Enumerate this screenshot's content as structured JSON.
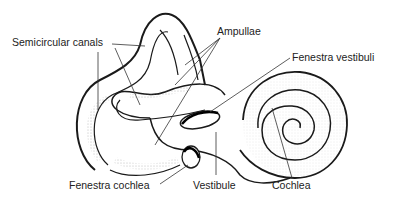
{
  "diagram": {
    "labels": {
      "semicircular_canals": "Semicircular canals",
      "ampullae": "Ampullae",
      "fenestra_vestibuli": "Fenestra vestibuli",
      "fenestra_cochlea": "Fenestra cochlea",
      "vestibule": "Vestibule",
      "cochlea": "Cochlea"
    },
    "colors": {
      "line": "#1a1a1a",
      "leader": "#333333",
      "stipple": "#777777",
      "background": "#ffffff"
    }
  }
}
